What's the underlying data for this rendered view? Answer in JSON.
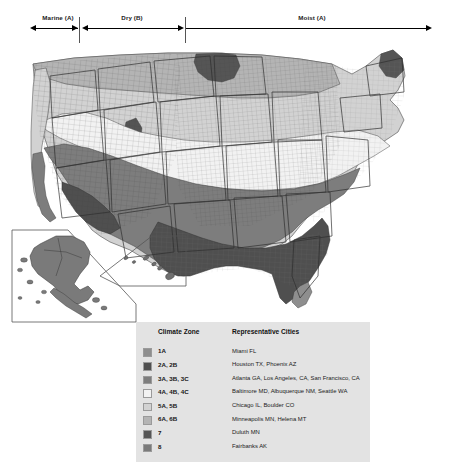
{
  "scale": {
    "regions": [
      {
        "label": "Marine (A)",
        "start_pct": 6.6,
        "end_pct": 17.0
      },
      {
        "label": "Dry (B)",
        "start_pct": 17.2,
        "end_pct": 40.1
      },
      {
        "label": "Moist (A)",
        "start_pct": 40.3,
        "end_pct": 93.6
      }
    ],
    "dividers_pct": [
      17.1,
      40.2
    ]
  },
  "legend": {
    "headers": {
      "zone": "Climate Zone",
      "cities": "Representative Cities"
    },
    "panel_color": "#e3e3e3",
    "rows": [
      {
        "zone": "1A",
        "cities": "Miami FL",
        "color": "#8e8e8e"
      },
      {
        "zone": "2A, 2B",
        "cities": "Houston TX,  Phoenix AZ",
        "color": "#4f4f4f"
      },
      {
        "zone": "3A, 3B, 3C",
        "cities": "Atlanta GA, Los Angeles, CA, San Francisco, CA",
        "color": "#7d7d7d"
      },
      {
        "zone": "4A, 4B, 4C",
        "cities": "Baltimore MD, Albuquerque NM, Seattle WA",
        "color": "#f2f2f2"
      },
      {
        "zone": "5A, 5B",
        "cities": "Chicago IL, Boulder CO",
        "color": "#d2d2d2"
      },
      {
        "zone": "6A, 6B",
        "cities": "Minneapolis MN, Helena MT",
        "color": "#b4b4b4"
      },
      {
        "zone": "7",
        "cities": "Duluth MN",
        "color": "#555555"
      },
      {
        "zone": "8",
        "cities": "Fairbanks AK",
        "color": "#7a7a7a"
      }
    ]
  },
  "map": {
    "alt": "County-level choropleth map of the contiguous United States with Alaska and Hawaii insets, shaded by climate zone",
    "insets": [
      "Alaska",
      "Hawaii"
    ]
  }
}
